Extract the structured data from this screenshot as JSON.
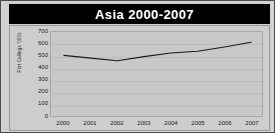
{
  "chart_data": {
    "type": "line",
    "title": "Asia 2000-2007",
    "xlabel": "",
    "ylabel": "Port Callings '000s",
    "categories": [
      "2000",
      "2001",
      "2002",
      "2003",
      "2004",
      "2005",
      "2006",
      "2007"
    ],
    "x": [
      2000,
      2001,
      2002,
      2003,
      2004,
      2005,
      2006,
      2007
    ],
    "values": [
      505,
      482,
      460,
      495,
      525,
      540,
      575,
      615
    ],
    "series": [
      {
        "name": "Port Callings",
        "values": [
          505,
          482,
          460,
          495,
          525,
          540,
          575,
          615
        ]
      }
    ],
    "ylim": [
      0,
      700
    ],
    "yticks": [
      0,
      100,
      200,
      300,
      400,
      500,
      600,
      700
    ],
    "ytick_labels": [
      "0",
      "100",
      "200",
      "300",
      "400",
      "500",
      "600",
      "700"
    ],
    "grid": true,
    "legend": false,
    "legend_position": "none",
    "line_color": "#1a1a1a",
    "plot_background": "#c8c8c8",
    "title_background": "#000000",
    "title_color": "#ffffff",
    "figure_background": "#cfcfcf"
  }
}
